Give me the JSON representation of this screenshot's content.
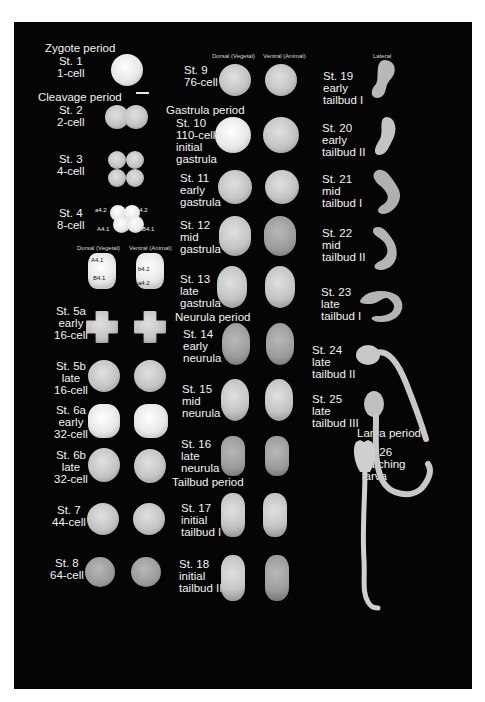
{
  "figure": {
    "background_color": "#050505",
    "text_color": "#f2f2f2",
    "column_headers": {
      "left_dorsal": "Dorsal (Vegetal)",
      "left_ventral": "Ventral (Animal)",
      "mid_dorsal": "Dorsal (Vegetal)",
      "mid_ventral": "Ventral (Animal)",
      "lateral": "Lateral"
    },
    "periods": {
      "zygote": "Zygote period",
      "cleavage": "Cleavage period",
      "gastrula": "Gastrula period",
      "neurula": "Neurula period",
      "tailbud": "Tailbud period",
      "larva": "Larva period"
    },
    "stages": [
      {
        "id": "st1",
        "label": "St. 1\n1-cell"
      },
      {
        "id": "st2",
        "label": "St. 2\n2-cell"
      },
      {
        "id": "st3",
        "label": "St. 3\n4-cell"
      },
      {
        "id": "st4",
        "label": "St. 4\n8-cell"
      },
      {
        "id": "st5a",
        "label": "St. 5a\nearly\n16-cell"
      },
      {
        "id": "st5b",
        "label": "St. 5b\nlate\n16-cell"
      },
      {
        "id": "st6a",
        "label": "St. 6a\nearly\n32-cell"
      },
      {
        "id": "st6b",
        "label": "St. 6b\nlate\n32-cell"
      },
      {
        "id": "st7",
        "label": "St. 7\n44-cell"
      },
      {
        "id": "st8",
        "label": "St. 8\n64-cell"
      },
      {
        "id": "st9",
        "label": "St. 9\n76-cell"
      },
      {
        "id": "st10",
        "label": "St. 10\n110-cell\ninitial\ngastrula"
      },
      {
        "id": "st11",
        "label": "St. 11\nearly\ngastrula"
      },
      {
        "id": "st12",
        "label": "St. 12\nmid\ngastrula"
      },
      {
        "id": "st13",
        "label": "St. 13\nlate\ngastrula"
      },
      {
        "id": "st14",
        "label": "St. 14\nearly\nneurula"
      },
      {
        "id": "st15",
        "label": "St. 15\nmid\nneurula"
      },
      {
        "id": "st16",
        "label": "St. 16\nlate\nneurula"
      },
      {
        "id": "st17",
        "label": "St. 17\ninitial\ntailbud I"
      },
      {
        "id": "st18",
        "label": "St. 18\ninitial\ntailbud II"
      },
      {
        "id": "st19",
        "label": "St. 19\nearly\ntailbud I"
      },
      {
        "id": "st20",
        "label": "St. 20\nearly\ntailbud II"
      },
      {
        "id": "st21",
        "label": "St. 21\nmid\ntailbud I"
      },
      {
        "id": "st22",
        "label": "St. 22\nmid\ntailbud II"
      },
      {
        "id": "st23",
        "label": "St. 23\nlate\ntailbud I"
      },
      {
        "id": "st24",
        "label": "St. 24\nlate\ntailbud II"
      },
      {
        "id": "st25",
        "label": "St. 25\nlate\ntailbud III"
      },
      {
        "id": "st26",
        "label": "St. 26\nhatching\nlarva"
      }
    ],
    "cell_labels": {
      "st4_a42_left": "a4.2",
      "st4_b42_right": "b4.2",
      "st4_A41": "A4.1",
      "st4_B41": "B4.1",
      "detail_dorsal_A41": "A4.1",
      "detail_dorsal_B41": "B4.1",
      "detail_ventral_b42": "b4.2",
      "detail_ventral_a42": "a4.2"
    }
  }
}
